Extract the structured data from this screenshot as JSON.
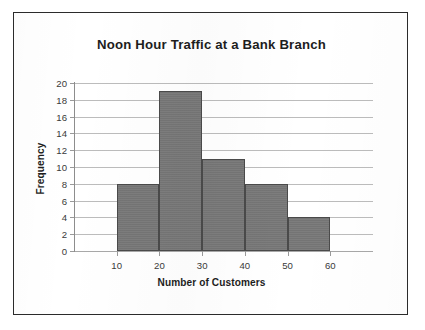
{
  "figure": {
    "border_color": "#2b2b2b",
    "background_color": "#ffffff"
  },
  "chart_data": {
    "type": "bar",
    "title": "Noon Hour Traffic at a Bank Branch",
    "xlabel": "Number of Customers",
    "ylabel": "Frequency",
    "subtitle": "",
    "grid": true,
    "legend": null,
    "legend_position": "none",
    "bar_color": "#767676",
    "bar_edge_color": "#4a4a4a",
    "gridline_color": "#bcbcbc",
    "axis_color": "#8d8d8d",
    "histogram": true,
    "bin_width": 10,
    "bin_edges": [
      10,
      20,
      30,
      40,
      50,
      60
    ],
    "categories": [
      "10-20",
      "20-30",
      "30-40",
      "40-50",
      "50-60"
    ],
    "values": [
      8,
      19,
      11,
      8,
      4
    ],
    "xlim": [
      0,
      70
    ],
    "ylim": [
      0,
      20
    ],
    "xticks": [
      10,
      20,
      30,
      40,
      50,
      60
    ],
    "xtick_labels": [
      "10",
      "20",
      "30",
      "40",
      "50",
      "60"
    ],
    "yticks": [
      0,
      2,
      4,
      6,
      8,
      10,
      12,
      14,
      16,
      18,
      20
    ],
    "ytick_labels": [
      "0",
      "2",
      "4",
      "6",
      "8",
      "10",
      "12",
      "14",
      "16",
      "18",
      "20"
    ]
  }
}
